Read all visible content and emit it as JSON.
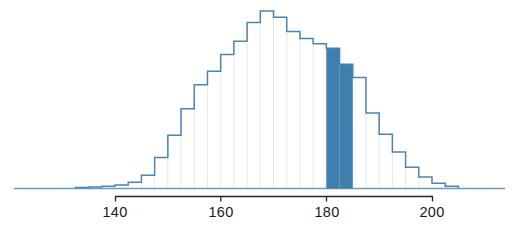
{
  "chart_data": {
    "type": "bar",
    "title": "",
    "subtitle": "",
    "xlabel": "height (cm)",
    "ylabel": "",
    "grid": true,
    "legend": null,
    "legend_position": "none",
    "xlim": [
      132,
      207
    ],
    "ylim": [
      0,
      1
    ],
    "bin_width": 2.5,
    "xticks": [
      140,
      160,
      180,
      200
    ],
    "xticklabels": [
      "140",
      "160",
      "180",
      "200"
    ],
    "yticks": [],
    "yticklabels": [],
    "annotations": [
      {
        "name": "shaded-region",
        "kind": "highlighted-bins",
        "x_start": 180,
        "x_end": 185,
        "color": "#3d7fad",
        "label": ""
      }
    ],
    "categories": [
      "132.5-135",
      "135-137.5",
      "137.5-140",
      "140-142.5",
      "142.5-145",
      "145-147.5",
      "147.5-150",
      "150-152.5",
      "152.5-155",
      "155-157.5",
      "157.5-160",
      "160-162.5",
      "162.5-165",
      "165-167.5",
      "167.5-170",
      "170-172.5",
      "172.5-175",
      "175-177.5",
      "177.5-180",
      "180-182.5",
      "182.5-185",
      "185-187.5",
      "187.5-190",
      "190-192.5",
      "192.5-195",
      "195-197.5",
      "197.5-200",
      "200-202.5",
      "202.5-205"
    ],
    "bin_left_edges": [
      132.5,
      135,
      137.5,
      140,
      142.5,
      145,
      147.5,
      150,
      152.5,
      155,
      157.5,
      160,
      162.5,
      165,
      167.5,
      170,
      172.5,
      175,
      177.5,
      180,
      182.5,
      185,
      187.5,
      190,
      192.5,
      195,
      197.5,
      200,
      202.5
    ],
    "values": [
      0.005,
      0.008,
      0.012,
      0.02,
      0.035,
      0.075,
      0.175,
      0.3,
      0.45,
      0.585,
      0.66,
      0.755,
      0.83,
      0.935,
      1.0,
      0.965,
      0.885,
      0.845,
      0.815,
      0.79,
      0.7,
      0.625,
      0.425,
      0.305,
      0.205,
      0.12,
      0.065,
      0.03,
      0.012
    ],
    "highlighted": [
      false,
      false,
      false,
      false,
      false,
      false,
      false,
      false,
      false,
      false,
      false,
      false,
      false,
      false,
      false,
      false,
      false,
      false,
      false,
      true,
      true,
      false,
      false,
      false,
      false,
      false,
      false,
      false,
      false
    ],
    "colors": {
      "bar_stroke": "#4a84b5",
      "bar_fill": "#ffffff",
      "highlight_fill": "#3d7fad",
      "gridline": "#e8e8e8",
      "axis_line": "#262626",
      "baseline": "#6a9bc3",
      "text": "#1a1a1a",
      "background": "#ffffff"
    }
  },
  "axis": {
    "title": "height (cm)",
    "tick_140": "140",
    "tick_160": "160",
    "tick_180": "180",
    "tick_200": "200"
  }
}
